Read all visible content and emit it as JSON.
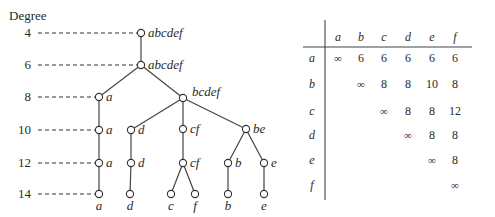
{
  "dendrogram": {
    "axis_label": "Degree",
    "degrees": [
      {
        "value": "4",
        "y": 33
      },
      {
        "value": "6",
        "y": 65
      },
      {
        "value": "8",
        "y": 97
      },
      {
        "value": "10",
        "y": 130
      },
      {
        "value": "12",
        "y": 163
      },
      {
        "value": "14",
        "y": 194
      }
    ],
    "nodes": [
      {
        "id": "n4",
        "label": "abcdef",
        "x": 141,
        "y": 33,
        "label_pos": "right"
      },
      {
        "id": "n6",
        "label": "abcdef",
        "x": 141,
        "y": 65,
        "label_pos": "right"
      },
      {
        "id": "a8",
        "label": "a",
        "x": 99,
        "y": 97,
        "label_pos": "right"
      },
      {
        "id": "bcdef8",
        "label": "bcdef",
        "x": 183,
        "y": 98,
        "label_pos": "upright"
      },
      {
        "id": "a10",
        "label": "a",
        "x": 99,
        "y": 130,
        "label_pos": "right"
      },
      {
        "id": "d10",
        "label": "d",
        "x": 131,
        "y": 130,
        "label_pos": "right"
      },
      {
        "id": "cf10",
        "label": "cf",
        "x": 183,
        "y": 129,
        "label_pos": "right"
      },
      {
        "id": "be10",
        "label": "be",
        "x": 246,
        "y": 129,
        "label_pos": "right"
      },
      {
        "id": "a12",
        "label": "a",
        "x": 99,
        "y": 163,
        "label_pos": "right"
      },
      {
        "id": "d12",
        "label": "d",
        "x": 131,
        "y": 163,
        "label_pos": "right"
      },
      {
        "id": "cf12",
        "label": "cf",
        "x": 183,
        "y": 163,
        "label_pos": "right"
      },
      {
        "id": "b12",
        "label": "b",
        "x": 228,
        "y": 163,
        "label_pos": "right"
      },
      {
        "id": "e12",
        "label": "e",
        "x": 264,
        "y": 163,
        "label_pos": "right"
      },
      {
        "id": "a14",
        "label": "a",
        "x": 99,
        "y": 194,
        "label_pos": "below"
      },
      {
        "id": "d14",
        "label": "d",
        "x": 130,
        "y": 194,
        "label_pos": "below"
      },
      {
        "id": "c14",
        "label": "c",
        "x": 171,
        "y": 194,
        "label_pos": "below"
      },
      {
        "id": "f14",
        "label": "f",
        "x": 195,
        "y": 194,
        "label_pos": "below"
      },
      {
        "id": "b14",
        "label": "b",
        "x": 228,
        "y": 194,
        "label_pos": "below"
      },
      {
        "id": "e14",
        "label": "e",
        "x": 264,
        "y": 194,
        "label_pos": "below"
      }
    ],
    "edges": [
      [
        "n4",
        "n6"
      ],
      [
        "n6",
        "a8"
      ],
      [
        "n6",
        "bcdef8"
      ],
      [
        "a8",
        "a10"
      ],
      [
        "bcdef8",
        "d10"
      ],
      [
        "bcdef8",
        "cf10"
      ],
      [
        "bcdef8",
        "be10"
      ],
      [
        "a10",
        "a12"
      ],
      [
        "d10",
        "d12"
      ],
      [
        "cf10",
        "cf12"
      ],
      [
        "be10",
        "b12"
      ],
      [
        "be10",
        "e12"
      ],
      [
        "a12",
        "a14"
      ],
      [
        "d12",
        "d14"
      ],
      [
        "cf12",
        "c14"
      ],
      [
        "cf12",
        "f14"
      ],
      [
        "b12",
        "b14"
      ],
      [
        "e12",
        "e14"
      ]
    ]
  },
  "matrix": {
    "columns": [
      "a",
      "b",
      "c",
      "d",
      "e",
      "f"
    ],
    "rows": [
      {
        "label": "a",
        "cells": [
          "∞",
          "6",
          "6",
          "6",
          "6",
          "6"
        ]
      },
      {
        "label": "b",
        "cells": [
          "",
          "∞",
          "8",
          "8",
          "10",
          "8"
        ]
      },
      {
        "label": "c",
        "cells": [
          "",
          "",
          "∞",
          "8",
          "8",
          "12"
        ]
      },
      {
        "label": "d",
        "cells": [
          "",
          "",
          "",
          "∞",
          "8",
          "8"
        ]
      },
      {
        "label": "e",
        "cells": [
          "",
          "",
          "",
          "",
          "∞",
          "8"
        ]
      },
      {
        "label": "f",
        "cells": [
          "",
          "",
          "",
          "",
          "",
          "∞"
        ]
      }
    ]
  }
}
